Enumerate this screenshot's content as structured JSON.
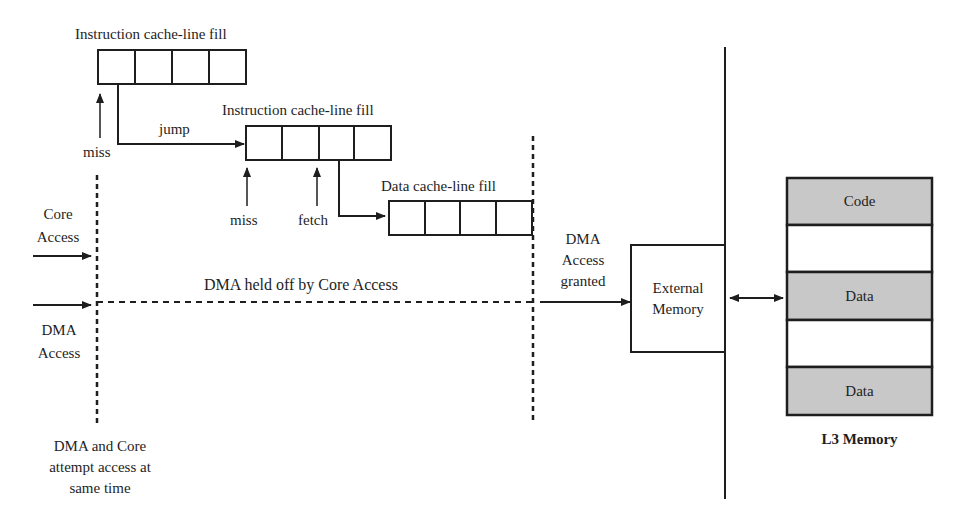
{
  "diagram": {
    "instruction_fill_1": {
      "label": "Instruction cache-line fill",
      "miss_label": "miss",
      "jump_label": "jump"
    },
    "instruction_fill_2": {
      "label": "Instruction cache-line fill",
      "miss_label": "miss",
      "fetch_label": "fetch"
    },
    "data_fill": {
      "label": "Data cache-line fill"
    },
    "core_access": {
      "line1": "Core",
      "line2": "Access"
    },
    "dma_access": {
      "line1": "DMA",
      "line2": "Access"
    },
    "dma_held_off": "DMA held off by Core Access",
    "dma_granted": {
      "line1": "DMA",
      "line2": "Access",
      "line3": "granted"
    },
    "simultaneous": {
      "line1": "DMA and Core",
      "line2": "attempt access at",
      "line3": "same time"
    },
    "external_memory": {
      "line1": "External",
      "line2": "Memory"
    },
    "l3_memory": {
      "title": "L3 Memory",
      "segments": [
        {
          "label": "Code",
          "filled": true
        },
        {
          "label": "",
          "filled": false
        },
        {
          "label": "Data",
          "filled": true
        },
        {
          "label": "",
          "filled": false
        },
        {
          "label": "Data",
          "filled": true
        }
      ]
    },
    "colors": {
      "line": "#1e1e1e",
      "segment_fill": "#c8c8c8",
      "background": "#ffffff"
    }
  }
}
